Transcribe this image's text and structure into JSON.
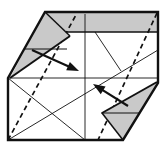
{
  "figure": {
    "canvas": {
      "width": 165,
      "height": 149
    },
    "colors": {
      "paper": "#ffffff",
      "shaded": "#c9c9c9",
      "line": "#111111"
    },
    "outline": {
      "points": [
        [
          45,
          12
        ],
        [
          158,
          12
        ],
        [
          158,
          83
        ],
        [
          123,
          140
        ],
        [
          8,
          140
        ],
        [
          8,
          78
        ]
      ],
      "stroke_width": 2.4
    },
    "shaded_band": {
      "points": [
        [
          45,
          12
        ],
        [
          158,
          12
        ],
        [
          158,
          32
        ],
        [
          66,
          32
        ]
      ],
      "bottom_edge": {
        "from": [
          66,
          32
        ],
        "to": [
          158,
          32
        ]
      },
      "edge_width": 1.5
    },
    "flaps": [
      {
        "name": "top-left-flap",
        "points": [
          [
            45,
            12
          ],
          [
            70,
            36
          ],
          [
            10,
            78
          ]
        ],
        "fold_edge": {
          "from": [
            10,
            78
          ],
          "to": [
            70,
            36
          ],
          "width": 2.0
        },
        "inner_edge": {
          "from": [
            45,
            12
          ],
          "to": [
            70,
            36
          ],
          "width": 1.5
        },
        "crease": {
          "from": [
            24,
            49
          ],
          "to": [
            67,
            49
          ],
          "width": 1.0
        }
      },
      {
        "name": "bottom-right-flap",
        "points": [
          [
            157,
            82
          ],
          [
            102,
            113
          ],
          [
            123,
            140
          ]
        ],
        "fold_edge": {
          "from": [
            157,
            82
          ],
          "to": [
            102,
            113
          ],
          "width": 2.0
        },
        "inner_edge": {
          "from": [
            102,
            113
          ],
          "to": [
            123,
            140
          ],
          "width": 1.5
        },
        "crease": {
          "from": [
            101,
            113
          ],
          "to": [
            140,
            113
          ],
          "width": 1.0
        }
      }
    ],
    "creases": [
      {
        "name": "vertical-center-crease",
        "from": [
          85,
          14
        ],
        "to": [
          85,
          139
        ]
      },
      {
        "name": "horizontal-center-crease",
        "from": [
          8,
          78
        ],
        "to": [
          158,
          78
        ]
      },
      {
        "name": "long-diagonal-crease",
        "from": [
          8,
          140
        ],
        "to": [
          158,
          50
        ]
      },
      {
        "name": "upper-right-diagonal-crease",
        "from": [
          95,
          32
        ],
        "to": [
          121,
          71
        ]
      },
      {
        "name": "lower-left-diagonal-crease",
        "from": [
          8,
          78
        ],
        "to": [
          85,
          140
        ]
      }
    ],
    "crease_width": 0.9,
    "valley_folds": [
      {
        "name": "left-valley-fold",
        "from": [
          8,
          140
        ],
        "to": [
          77,
          13
        ]
      },
      {
        "name": "right-valley-fold",
        "from": [
          157,
          13
        ],
        "to": [
          98,
          140
        ]
      }
    ],
    "valley_dash": "5 3.5",
    "valley_width": 1.7,
    "arrows": [
      {
        "name": "fold-arrow-down-right",
        "tail": [
          32,
          50
        ],
        "tip": [
          79,
          71
        ]
      },
      {
        "name": "fold-arrow-up-left",
        "tail": [
          128,
          106
        ],
        "tip": [
          93,
          84
        ]
      }
    ],
    "arrow_shaft_width": 2.2,
    "arrow_head": {
      "length": 12,
      "width": 9
    }
  }
}
